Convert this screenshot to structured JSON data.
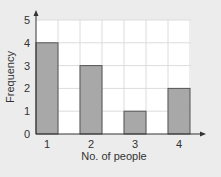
{
  "chart_data": {
    "type": "bar",
    "title": "",
    "xlabel": "No. of people",
    "ylabel": "Frequency",
    "categories": [
      "1",
      "2",
      "3",
      "4"
    ],
    "values": [
      4,
      3,
      1,
      2
    ],
    "ylim": [
      0,
      5
    ],
    "yticks": [
      "0",
      "1",
      "2",
      "3",
      "4",
      "5"
    ],
    "grid": true,
    "legend": null,
    "colors": {
      "bar_fill": "#a8a8a8",
      "bar_stroke": "#555555",
      "plot_bg": "#ffffff",
      "page_bg": "#ececec",
      "grid": "#dcdcdc",
      "axis": "#333333"
    }
  }
}
